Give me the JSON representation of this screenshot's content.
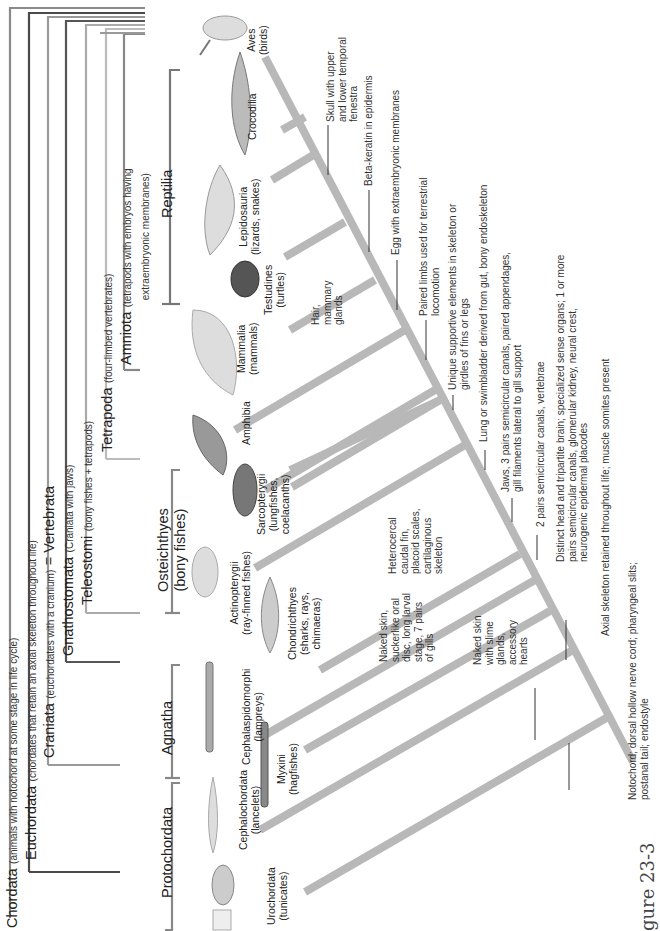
{
  "figure_label": "gure 23-3",
  "groups": {
    "chordata": {
      "name": "Chordata",
      "desc": "(animals with notochord at some stage in life cycle)"
    },
    "euchordata": {
      "name": "Euchordata",
      "desc": "(chordates that retain an axial skeleton throughout life)"
    },
    "craniata": {
      "name": "Craniata",
      "desc": "(euchordates with a cranium)",
      "equiv": "= Vertebrata"
    },
    "gnathostomata": {
      "name": "Gnathostomata",
      "desc": "(Craniata with jaws)"
    },
    "teleostomi": {
      "name": "Teleostomi",
      "desc": "(bony fishes + tetrapods)"
    },
    "tetrapoda": {
      "name": "Tetrapoda",
      "desc": "(four-limbed vertebrates)"
    },
    "amniota": {
      "name": "Amniota",
      "desc_line1": "(tetrapods with embryos having",
      "desc_line2": "extraembryonic membranes)"
    },
    "reptilia": {
      "name": "Reptilia"
    },
    "osteichthyes": {
      "name": "Osteichthyes",
      "desc": "(bony fishes)"
    },
    "agnatha": {
      "name": "Agnatha"
    },
    "protochordata": {
      "name": "Protochordata"
    }
  },
  "taxa": [
    {
      "name": "Urochordata",
      "common": "(tunicates)"
    },
    {
      "name": "Cephalochordata",
      "common": "(lancelets)"
    },
    {
      "name": "Myxini",
      "common": "(hagfishes)"
    },
    {
      "name": "Cephalaspidomorphi",
      "common": "(lampreys)"
    },
    {
      "name": "Chondrichthyes",
      "common_line1": "(sharks, rays,",
      "common_line2": "chimaeras)"
    },
    {
      "name": "Actinopterygii",
      "common": "(ray-finned fishes)"
    },
    {
      "name": "Sarcopterygii",
      "common_line1": "(lungfishes,",
      "common_line2": "coelacanths)"
    },
    {
      "name": "Amphibia"
    },
    {
      "name": "Mammalia",
      "common": "(mammals)"
    },
    {
      "name": "Testudines",
      "common": "(turtles)"
    },
    {
      "name": "Lepidosauria",
      "common": "(lizards, snakes)"
    },
    {
      "name": "Crocodilia"
    },
    {
      "name": "Aves",
      "common": "(birds)"
    }
  ],
  "branch_traits": {
    "hagfish": [
      "Naked skin",
      "with slime",
      "glands,",
      "accessory",
      "hearts"
    ],
    "lamprey": [
      "Naked skin,",
      "suckerlike oral",
      "disc, long larval",
      "stage, 7 pairs",
      "of gills"
    ],
    "chondrichthyes": [
      "Heterocercal",
      "caudal fin,",
      "placoid scales,",
      "cartilaginous",
      "skeleton"
    ],
    "mammalia": [
      "Hair,",
      "mammary",
      "glands"
    ]
  },
  "characters": [
    {
      "line1": "Notochord; dorsal hollow nerve cord; pharyngeal slits;",
      "line2": "postanal tail; endostyle"
    },
    {
      "line1": "Axial skeleton retained throughout life; muscle somites present"
    },
    {
      "line1": "Distinct head and tripartite brain; specialized sense organs; 1 or more",
      "line2": "pairs semicircular canals, glomerular kidney, neural crest,",
      "line3": "neurogenic epidermal placodes"
    },
    {
      "line1": "2 pairs semicircular canals, vertebrae"
    },
    {
      "line1": "Jaws, 3 pairs semicircular canals, paired appendages,",
      "line2": "gill filaments lateral to gill support"
    },
    {
      "line1": "Lung or swimbladder derived from gut, bony endoskeleton"
    },
    {
      "line1": "Unique supportive elements in skeleton or",
      "line2": "girdles of fins or legs"
    },
    {
      "line1": "Paired limbs used for terrestrial",
      "line2": "locomotion"
    },
    {
      "line1": "Egg with extraembryonic membranes"
    },
    {
      "line1": "Beta-keratin in epidermis"
    },
    {
      "line1": "Skull with upper",
      "line2": "and lower temporal",
      "line3": "fenestra"
    }
  ],
  "colors": {
    "branch": "#b5b5b5",
    "bracket_dark": "#4a4a4a",
    "bracket_mid": "#7a7a7a",
    "bracket_light": "#a8a8a8",
    "text": "#222222"
  }
}
